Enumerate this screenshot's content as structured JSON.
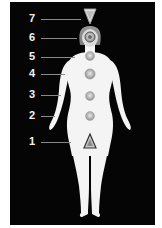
{
  "diagram": {
    "type": "chakra-body-map",
    "background_color": "#050505",
    "figure_color": "#f4f4f4",
    "label_color": "#f2f2f2",
    "chakras": [
      {
        "number": "7",
        "shape": "triangle-inverted",
        "label_y": 19
      },
      {
        "number": "6",
        "shape": "circle",
        "label_y": 38
      },
      {
        "number": "5",
        "shape": "circle",
        "label_y": 57
      },
      {
        "number": "4",
        "shape": "circle",
        "label_y": 74
      },
      {
        "number": "3",
        "shape": "circle",
        "label_y": 95
      },
      {
        "number": "2",
        "shape": "circle",
        "label_y": 116
      },
      {
        "number": "1",
        "shape": "triangle",
        "label_y": 142
      }
    ]
  }
}
